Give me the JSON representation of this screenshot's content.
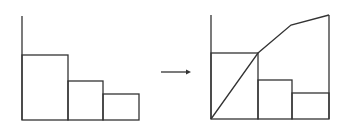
{
  "diagram": {
    "stroke_color": "#333333",
    "left_chart": {
      "type": "histogram",
      "bars": [
        {
          "x0": 22,
          "x1": 68,
          "top": 55
        },
        {
          "x0": 68,
          "x1": 103,
          "top": 81
        },
        {
          "x0": 103,
          "x1": 139,
          "top": 94
        }
      ],
      "axis_x": 22,
      "axis_top": 16,
      "baseline": 120
    },
    "arrow": {
      "x1": 161,
      "x2": 191,
      "y": 72
    },
    "right_chart": {
      "type": "histogram-with-cumulative-line",
      "bars": [
        {
          "x0": 211,
          "x1": 258,
          "top": 53
        },
        {
          "x0": 258,
          "x1": 292,
          "top": 80
        },
        {
          "x0": 292,
          "x1": 329,
          "top": 93
        }
      ],
      "cumulative_points": [
        [
          211,
          119
        ],
        [
          258,
          53
        ],
        [
          291,
          25
        ],
        [
          329,
          15
        ]
      ],
      "axis_x": 211,
      "axis_top": 15,
      "baseline": 119,
      "right_edge": 329
    }
  },
  "chart_data": [
    {
      "type": "bar",
      "title": "",
      "categories": [
        "1",
        "2",
        "3"
      ],
      "values": [
        65,
        39,
        26
      ],
      "xlabel": "",
      "ylabel": ""
    },
    {
      "type": "bar+line",
      "title": "",
      "categories": [
        "1",
        "2",
        "3"
      ],
      "series": [
        {
          "name": "bars",
          "values": [
            66,
            39,
            26
          ]
        },
        {
          "name": "cumulative",
          "values": [
            66,
            94,
            104
          ]
        }
      ],
      "xlabel": "",
      "ylabel": ""
    }
  ]
}
